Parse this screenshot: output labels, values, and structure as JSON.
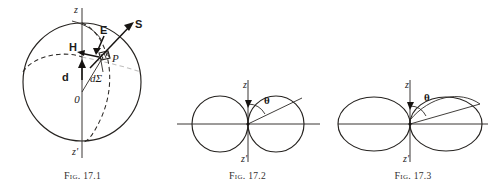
{
  "page": {
    "background_color": "#ffffff",
    "ink_color": "#262320"
  },
  "figures": [
    {
      "id": "fig-17-1",
      "caption_word": "Fig.",
      "caption_number": "17.1",
      "description": "Sphere with polar axis z-z', origin O, surface element dSigma at point P, with vectors S, E, H and d",
      "labels": {
        "axis_top": "z",
        "axis_bottom": "z'",
        "origin": "0",
        "point": "P",
        "surface_element": "dΣ",
        "vector_s": "S",
        "vector_e": "E",
        "vector_h": "H",
        "vector_d": "d"
      }
    },
    {
      "id": "fig-17-2",
      "caption_word": "Fig.",
      "caption_number": "17.2",
      "description": "Two tangent circles forming a dipole radiation pattern with polar angle theta measured from the z axis",
      "labels": {
        "axis_top": "z",
        "axis_bottom": "z'",
        "angle": "θ"
      }
    },
    {
      "id": "fig-17-3",
      "caption_word": "Fig.",
      "caption_number": "17.3",
      "description": "Two tangent elongated lobes forming a radiation pattern with polar angle theta measured from the z axis",
      "labels": {
        "axis_top": "z",
        "axis_bottom": "z'",
        "angle": "θ"
      }
    }
  ]
}
